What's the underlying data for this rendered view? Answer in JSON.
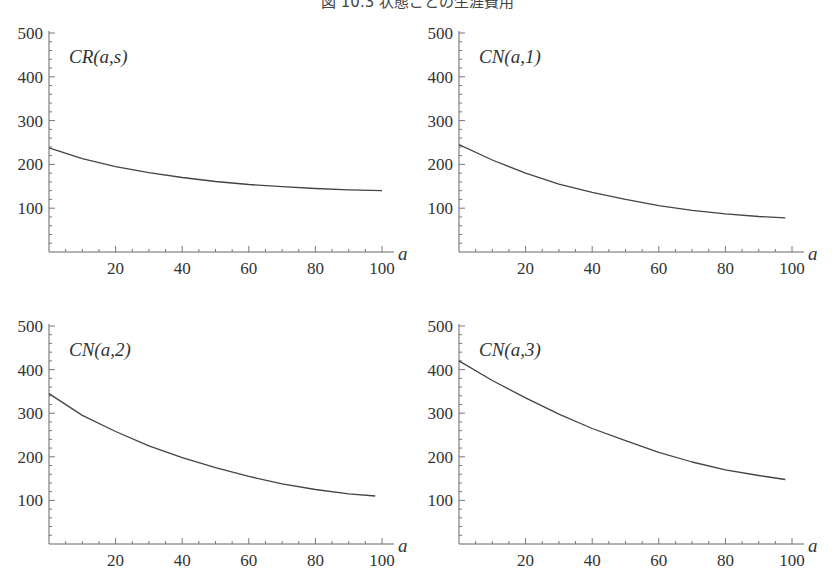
{
  "figure": {
    "title": "図 10.3 状態ごとの生涯費用"
  },
  "chart_data": [
    {
      "type": "line",
      "title": "CR(a,s)",
      "panel_label": "CR(a,s)",
      "xlabel": "a",
      "ylabel": "",
      "xlim": [
        0,
        100
      ],
      "ylim": [
        0,
        500
      ],
      "x_ticks": [
        20,
        40,
        60,
        80,
        100
      ],
      "y_ticks": [
        100,
        200,
        300,
        400,
        500
      ],
      "grid": false,
      "x": [
        0,
        10,
        20,
        30,
        40,
        50,
        60,
        70,
        80,
        90,
        100
      ],
      "values": [
        238,
        213,
        195,
        181,
        170,
        161,
        154,
        149,
        145,
        142,
        140
      ]
    },
    {
      "type": "line",
      "title": "CN(a,1)",
      "panel_label": "CN(a,1)",
      "xlabel": "a",
      "ylabel": "",
      "xlim": [
        0,
        100
      ],
      "ylim": [
        0,
        500
      ],
      "x_ticks": [
        20,
        40,
        60,
        80,
        100
      ],
      "y_ticks": [
        100,
        200,
        300,
        400,
        500
      ],
      "grid": false,
      "x": [
        0,
        10,
        20,
        30,
        40,
        50,
        60,
        70,
        80,
        90,
        98
      ],
      "values": [
        245,
        210,
        180,
        155,
        136,
        120,
        106,
        95,
        87,
        81,
        78
      ]
    },
    {
      "type": "line",
      "title": "CN(a,2)",
      "panel_label": "CN(a,2)",
      "xlabel": "a",
      "ylabel": "",
      "xlim": [
        0,
        100
      ],
      "ylim": [
        0,
        500
      ],
      "x_ticks": [
        20,
        40,
        60,
        80,
        100
      ],
      "y_ticks": [
        100,
        200,
        300,
        400,
        500
      ],
      "grid": false,
      "x": [
        0,
        10,
        20,
        30,
        40,
        50,
        60,
        70,
        80,
        90,
        98
      ],
      "values": [
        345,
        295,
        258,
        225,
        198,
        175,
        155,
        138,
        125,
        115,
        110
      ]
    },
    {
      "type": "line",
      "title": "CN(a,3)",
      "panel_label": "CN(a,3)",
      "xlabel": "a",
      "ylabel": "",
      "xlim": [
        0,
        100
      ],
      "ylim": [
        0,
        500
      ],
      "x_ticks": [
        20,
        40,
        60,
        80,
        100
      ],
      "y_ticks": [
        100,
        200,
        300,
        400,
        500
      ],
      "grid": false,
      "x": [
        0,
        10,
        20,
        30,
        40,
        50,
        60,
        70,
        80,
        90,
        98
      ],
      "values": [
        420,
        375,
        335,
        298,
        265,
        237,
        210,
        188,
        170,
        157,
        148
      ]
    }
  ],
  "panels": [
    {
      "label": "CR(a,s)",
      "x_var": "a"
    },
    {
      "label": "CN(a,1)",
      "x_var": "a"
    },
    {
      "label": "CN(a,2)",
      "x_var": "a"
    },
    {
      "label": "CN(a,3)",
      "x_var": "a"
    }
  ]
}
